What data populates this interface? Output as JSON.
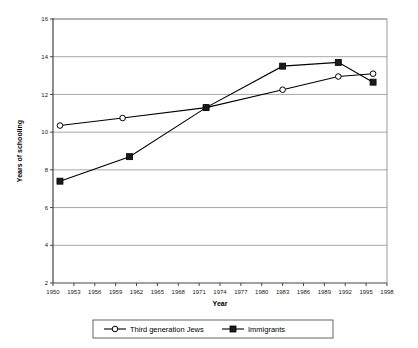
{
  "chart_data": {
    "type": "line",
    "title": "",
    "xlabel": "Year",
    "ylabel": "Years of schooling",
    "xlim": [
      1950,
      1998
    ],
    "ylim": [
      2,
      16
    ],
    "grid": "horizontal",
    "legend_position": "bottom",
    "xticks": [
      1950,
      1953,
      1956,
      1959,
      1962,
      1965,
      1968,
      1971,
      1974,
      1977,
      1980,
      1983,
      1986,
      1989,
      1992,
      1995,
      1998
    ],
    "yticks": [
      2,
      4,
      6,
      8,
      10,
      12,
      14,
      16
    ],
    "series": [
      {
        "name": "Third generation Jews",
        "marker": "open-circle",
        "color": "#000000",
        "points": [
          {
            "x": 1951,
            "y": 10.35
          },
          {
            "x": 1960,
            "y": 10.75
          },
          {
            "x": 1972,
            "y": 11.3
          },
          {
            "x": 1983,
            "y": 12.25
          },
          {
            "x": 1991,
            "y": 12.95
          },
          {
            "x": 1996,
            "y": 13.1
          }
        ]
      },
      {
        "name": "Immigrants",
        "marker": "filled-square",
        "color": "#000000",
        "points": [
          {
            "x": 1951,
            "y": 7.4
          },
          {
            "x": 1961,
            "y": 8.7
          },
          {
            "x": 1972,
            "y": 11.3
          },
          {
            "x": 1983,
            "y": 13.5
          },
          {
            "x": 1991,
            "y": 13.7
          },
          {
            "x": 1996,
            "y": 12.65
          }
        ]
      }
    ]
  },
  "legend": {
    "items": [
      {
        "label": "Third generation Jews",
        "marker": "open-circle"
      },
      {
        "label": "Immigrants",
        "marker": "filled-square"
      }
    ]
  },
  "axes": {
    "x_title": "Year",
    "y_title": "Years of schooling"
  },
  "colors": {
    "line": "#000000",
    "grid": "#808080",
    "axis": "#555555",
    "background": "#ffffff"
  }
}
